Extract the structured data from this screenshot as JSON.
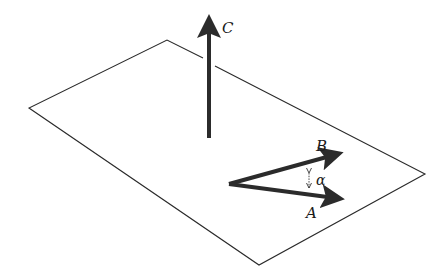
{
  "diagram": {
    "labels": {
      "C": "C",
      "B": "B",
      "A": "A",
      "alpha": "α"
    },
    "colors": {
      "plane_stroke": "#2a2a2a",
      "vector": "#2b2b2b",
      "background": "#ffffff"
    }
  }
}
